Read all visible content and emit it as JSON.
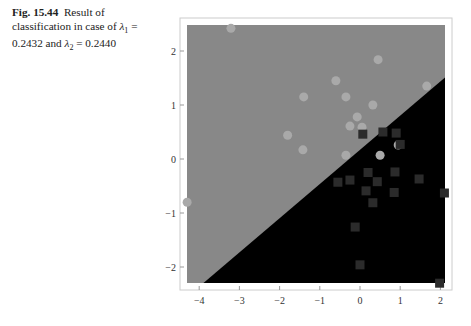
{
  "caption": {
    "figure_label": "Fig. 15.44",
    "text": "Result of classification in case of λ₁ = 0.2432 and λ₂ = 0.2440",
    "line1_rest": "Result of",
    "line2": "classification in case of ",
    "lambda1_symbol": "λ",
    "lambda1_sub": "1",
    "eq1": " =",
    "line3_val1": "0.2432 and ",
    "lambda2_symbol": "λ",
    "lambda2_sub": "2",
    "eq2": " = 0.2440"
  },
  "colors": {
    "class_a_region": "#888888",
    "class_b_region": "#000000",
    "class_a_points": "#a9a9a9",
    "class_b_points": "#2b2b2b",
    "frame": "#cccccc"
  },
  "chart_data": {
    "type": "scatter",
    "title": "",
    "xlabel": "",
    "ylabel": "",
    "xlim": [
      -4.3,
      2.1
    ],
    "ylim": [
      -2.3,
      2.5
    ],
    "x_ticks": [
      -4,
      -3,
      -2,
      -1,
      0,
      1,
      2
    ],
    "y_ticks": [
      -2,
      -1,
      0,
      1,
      2
    ],
    "grid": false,
    "legend": null,
    "decision_boundary": {
      "description": "straight line separating gray (upper-left) and black (lower-right) regions",
      "points": [
        [
          -3.9,
          -2.3
        ],
        [
          2.1,
          1.5
        ]
      ]
    },
    "series": [
      {
        "name": "class 1 (circles, gray region)",
        "marker": "circle",
        "points": [
          [
            -3.21,
            2.42
          ],
          [
            0.45,
            1.84
          ],
          [
            -0.6,
            1.45
          ],
          [
            -1.4,
            1.15
          ],
          [
            1.66,
            1.35
          ],
          [
            -0.35,
            1.15
          ],
          [
            0.32,
            1.0
          ],
          [
            -1.8,
            0.44
          ],
          [
            -1.42,
            0.17
          ],
          [
            -0.07,
            0.78
          ],
          [
            -0.25,
            0.61
          ],
          [
            0.05,
            0.59
          ],
          [
            -0.35,
            0.07
          ],
          [
            0.5,
            0.07
          ],
          [
            0.95,
            0.26
          ],
          [
            -4.3,
            -0.8
          ]
        ]
      },
      {
        "name": "class 2 (squares, black region)",
        "marker": "square",
        "points": [
          [
            0.07,
            0.46
          ],
          [
            0.57,
            0.5
          ],
          [
            0.9,
            0.48
          ],
          [
            1.0,
            0.27
          ],
          [
            0.2,
            -0.25
          ],
          [
            0.87,
            -0.24
          ],
          [
            -0.55,
            -0.43
          ],
          [
            -0.25,
            -0.39
          ],
          [
            0.15,
            -0.59
          ],
          [
            0.85,
            -0.62
          ],
          [
            1.47,
            -0.37
          ],
          [
            0.32,
            -0.81
          ],
          [
            -0.12,
            -1.26
          ],
          [
            0.43,
            -0.42
          ],
          [
            0.0,
            -1.96
          ],
          [
            2.1,
            -0.63
          ],
          [
            1.98,
            -2.3
          ]
        ]
      }
    ]
  }
}
